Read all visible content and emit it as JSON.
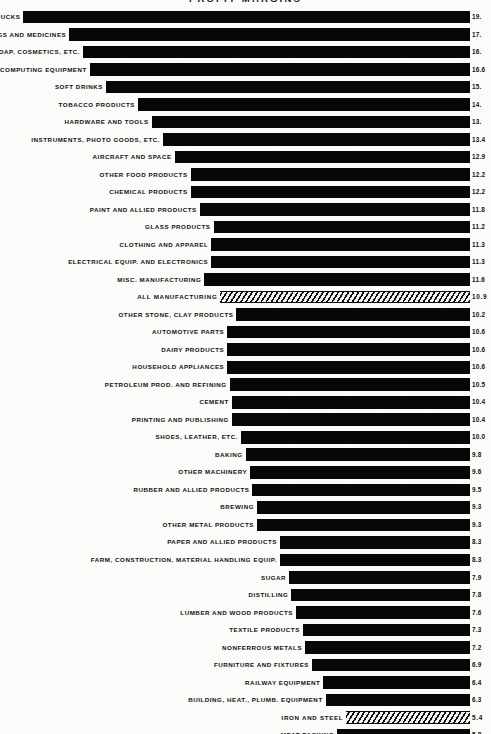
{
  "chart_data": {
    "type": "bar",
    "orientation": "horizontal",
    "title": "PROFIT MARGINS",
    "xlabel": "",
    "ylabel": "",
    "xlim": [
      0,
      20.5
    ],
    "grid": false,
    "legend": null,
    "bar_alignment": "right-aligned-baseline",
    "highlight_style": "diagonal-hatch",
    "categories": [
      "AUTOS AND TRUCKS",
      "DRUGS AND MEDICINES",
      "SOAP, COSMETICS, ETC.",
      "OFFICE, COMPUTING EQUIPMENT",
      "SOFT DRINKS",
      "TOBACCO PRODUCTS",
      "HARDWARE AND TOOLS",
      "INSTRUMENTS, PHOTO GOODS, ETC.",
      "AIRCRAFT AND SPACE",
      "OTHER FOOD PRODUCTS",
      "CHEMICAL PRODUCTS",
      "PAINT AND ALLIED PRODUCTS",
      "GLASS PRODUCTS",
      "CLOTHING AND APPAREL",
      "ELECTRICAL EQUIP. AND ELECTRONICS",
      "MISC. MANUFACTURING",
      "ALL MANUFACTURING",
      "OTHER STONE, CLAY PRODUCTS",
      "AUTOMOTIVE PARTS",
      "DAIRY PRODUCTS",
      "HOUSEHOLD APPLIANCES",
      "PETROLEUM PROD. AND REFINING",
      "CEMENT",
      "PRINTING AND PUBLISHING",
      "SHOES, LEATHER, ETC.",
      "BAKING",
      "OTHER MACHINERY",
      "RUBBER AND ALLIED PRODUCTS",
      "BREWING",
      "OTHER METAL PRODUCTS",
      "PAPER AND ALLIED PRODUCTS",
      "FARM, CONSTRUCTION, MATERIAL HANDLING EQUIP.",
      "SUGAR",
      "DISTILLING",
      "LUMBER AND WOOD PRODUCTS",
      "TEXTILE PRODUCTS",
      "NONFERROUS METALS",
      "FURNITURE AND FIXTURES",
      "RAILWAY EQUIPMENT",
      "BUILDING, HEAT., PLUMB. EQUIPMENT",
      "IRON AND STEEL",
      "MEAT PACKING"
    ],
    "values": [
      19.5,
      17.5,
      16.9,
      16.6,
      15.9,
      14.5,
      13.9,
      13.4,
      12.9,
      12.2,
      12.2,
      11.8,
      11.2,
      11.3,
      11.3,
      11.6,
      10.9,
      10.2,
      10.6,
      10.6,
      10.6,
      10.5,
      10.4,
      10.4,
      10.0,
      9.8,
      9.6,
      9.5,
      9.3,
      9.3,
      8.3,
      8.3,
      7.9,
      7.8,
      7.6,
      7.3,
      7.2,
      6.9,
      6.4,
      6.3,
      5.4,
      5.8
    ],
    "value_labels": [
      "19.",
      "17.",
      "16.",
      "16.6",
      "15.",
      "14.",
      "13.",
      "13.4",
      "12.9",
      "12.2",
      "12.2",
      "11.8",
      "11.2",
      "11.3",
      "11.3",
      "11.6",
      "10.9",
      "10.2",
      "10.6",
      "10.6",
      "10.6",
      "10.5",
      "10.4",
      "10.4",
      "10.0",
      "9.8",
      "9.6",
      "9.5",
      "9.3",
      "9.3",
      "8.3",
      "8.3",
      "7.9",
      "7.8",
      "7.6",
      "7.3",
      "7.2",
      "6.9",
      "6.4",
      "6.3",
      "5.4",
      "5.8"
    ],
    "highlighted": [
      "ALL MANUFACTURING",
      "IRON AND STEEL"
    ]
  }
}
